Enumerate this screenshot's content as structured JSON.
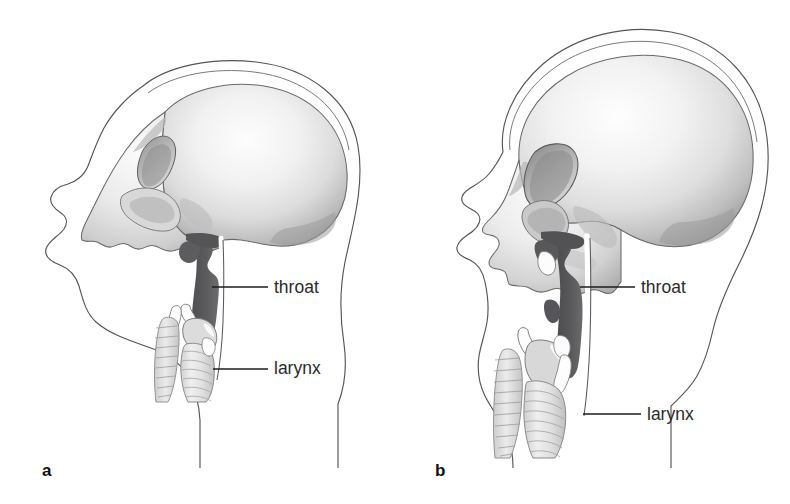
{
  "figure": {
    "background_color": "#ffffff",
    "ink_color": "#2b2b2b",
    "line_color": "#4a4a4a",
    "pharynx_color": "#565659",
    "bone_light": "#f2f2f2",
    "bone_mid": "#c9c9c9",
    "bone_dark": "#8c8c8c"
  },
  "panels": [
    {
      "id": "a",
      "letter": "a",
      "subject": "infant",
      "annotations": [
        {
          "name": "throat",
          "label": "throat",
          "leader": {
            "x1": 212,
            "y1": 287,
            "x2": 268,
            "y2": 287
          }
        },
        {
          "name": "larynx",
          "label": "larynx",
          "leader": {
            "x1": 213,
            "y1": 369,
            "x2": 268,
            "y2": 369
          }
        }
      ]
    },
    {
      "id": "b",
      "letter": "b",
      "subject": "adult",
      "annotations": [
        {
          "name": "throat",
          "label": "throat",
          "leader": {
            "x1": 185,
            "y1": 287,
            "x2": 240,
            "y2": 287
          }
        },
        {
          "name": "larynx",
          "label": "larynx",
          "leader": {
            "x1": 188,
            "y1": 414,
            "x2": 246,
            "y2": 414
          }
        }
      ]
    }
  ]
}
